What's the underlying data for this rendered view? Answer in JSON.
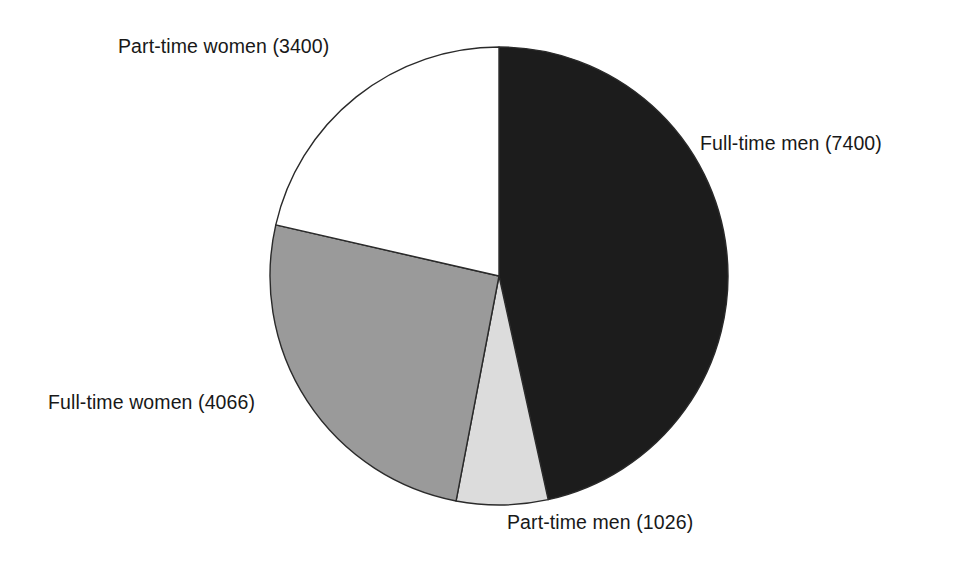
{
  "figure": {
    "background_color": "#ffffff",
    "outline_color": "#2a2a2a"
  },
  "chart_data": {
    "type": "pie",
    "title": "",
    "subtitle": "",
    "xlabel": "",
    "ylabel": "",
    "legend_position": "none",
    "grid": false,
    "start_angle_deg": 0,
    "direction": "clockwise",
    "total": 15892,
    "categories": [
      "Full-time men",
      "Part-time men",
      "Full-time women",
      "Part-time women"
    ],
    "values": [
      7400,
      1026,
      4066,
      3400
    ],
    "percentages": [
      46.6,
      6.5,
      25.6,
      21.4
    ],
    "colors": [
      "#1c1c1c",
      "#dcdcdc",
      "#9a9a9a",
      "#ffffff"
    ],
    "slices": [
      {
        "label": "Full-time men (7400)",
        "name": "Full-time men",
        "value": 7400,
        "percent": 46.6,
        "color": "#1c1c1c",
        "start_angle_deg": 0.0,
        "end_angle_deg": 167.6
      },
      {
        "label": "Part-time men (1026)",
        "name": "Part-time men",
        "value": 1026,
        "percent": 6.5,
        "color": "#dcdcdc",
        "start_angle_deg": 167.6,
        "end_angle_deg": 190.8
      },
      {
        "label": "Full-time women (4066)",
        "name": "Full-time women",
        "value": 4066,
        "percent": 25.6,
        "color": "#9a9a9a",
        "start_angle_deg": 190.8,
        "end_angle_deg": 282.9
      },
      {
        "label": "Part-time women (3400)",
        "name": "Part-time women",
        "value": 3400,
        "percent": 21.4,
        "color": "#ffffff",
        "start_angle_deg": 282.9,
        "end_angle_deg": 360.0
      }
    ],
    "geometry": {
      "center_x": 499,
      "center_y": 276,
      "radius": 229
    }
  }
}
